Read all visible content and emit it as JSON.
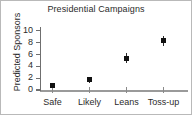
{
  "chart_data": {
    "type": "scatter",
    "title": "Presidential Campaigns",
    "xlabel": "",
    "ylabel": "Predicted Sponsors",
    "categories": [
      "Safe",
      "Likely",
      "Leans",
      "Toss-up"
    ],
    "values": [
      0.8,
      1.7,
      5.4,
      8.3
    ],
    "error_low": [
      0.6,
      1.2,
      4.6,
      7.4
    ],
    "error_high": [
      1.1,
      2.2,
      6.2,
      9.2
    ],
    "yticks": [
      0,
      2,
      4,
      6,
      8,
      10
    ],
    "ylim": [
      0,
      10.4
    ],
    "grid": false,
    "legend": "none",
    "marker": "square",
    "marker_color": "#111111",
    "axis_color": "#6f6f6f"
  },
  "axis": {
    "y_title": "Predicted Sponsors",
    "tick_labels_y": [
      "10",
      "8",
      "6",
      "4",
      "2",
      "0"
    ],
    "tick_labels_x": [
      "Safe",
      "Likely",
      "Leans",
      "Toss-up"
    ]
  }
}
